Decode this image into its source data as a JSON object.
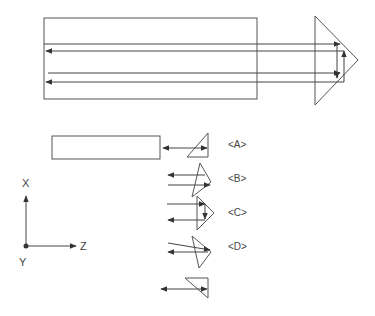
{
  "diagram": {
    "type": "optical-prism-reflection-schematic",
    "main": {
      "block": {
        "x": 44,
        "y": 18,
        "w": 213,
        "h": 81
      },
      "prism_triangle": [
        [
          315,
          16
        ],
        [
          358,
          60
        ],
        [
          315,
          105
        ]
      ],
      "beams": [
        {
          "y": 44,
          "from_x": 44,
          "to_x": 337,
          "direction": "right"
        },
        {
          "y": 51,
          "from_x": 344,
          "to_x": 46,
          "direction": "left"
        },
        {
          "y": 73,
          "from_x": 46,
          "to_x": 337,
          "direction": "right"
        },
        {
          "y": 82,
          "from_x": 344,
          "to_x": 46,
          "direction": "left"
        }
      ]
    },
    "variants": [
      {
        "id": "A",
        "label": "<A>"
      },
      {
        "id": "B",
        "label": "<B>"
      },
      {
        "id": "C",
        "label": "<C>"
      },
      {
        "id": "D",
        "label": "<D>"
      }
    ],
    "axes": {
      "x_label": "X",
      "z_label": "Z",
      "y_label": "Y"
    }
  }
}
